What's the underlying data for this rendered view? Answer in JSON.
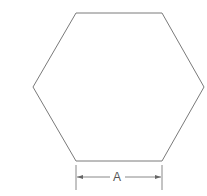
{
  "diagram": {
    "shape": "regular-hexagon",
    "stroke_color": "#7a7a7a",
    "vertices": [
      [
        76,
        13
      ],
      [
        162,
        13
      ],
      [
        204,
        87
      ],
      [
        162,
        161
      ],
      [
        76,
        161
      ],
      [
        33,
        87
      ]
    ],
    "dimension": {
      "label": "A",
      "from_x": 76,
      "to_x": 162,
      "y": 177,
      "extension_top": 165,
      "extension_bottom": 190
    }
  }
}
